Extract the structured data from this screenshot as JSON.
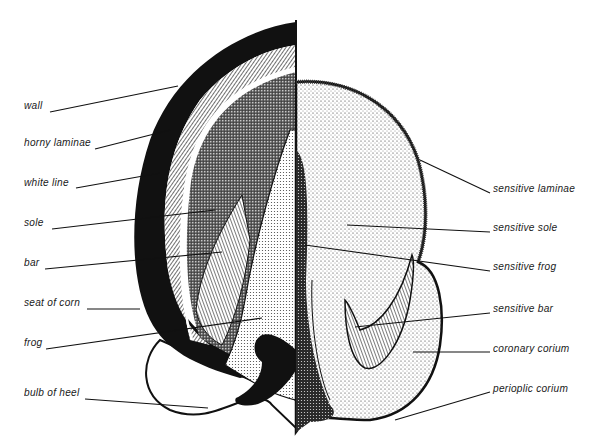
{
  "diagram": {
    "colors": {
      "ink": "#111111",
      "paper": "#ffffff"
    },
    "left_labels": [
      {
        "text": "wall",
        "x": 24,
        "y": 106,
        "line": [
          50,
          112,
          178,
          86
        ]
      },
      {
        "text": "horny laminae",
        "x": 24,
        "y": 143,
        "line": [
          95,
          149,
          170,
          130
        ]
      },
      {
        "text": "white line",
        "x": 24,
        "y": 183,
        "line": [
          76,
          188,
          160,
          173
        ]
      },
      {
        "text": "sole",
        "x": 24,
        "y": 223,
        "line": [
          52,
          229,
          215,
          210
        ]
      },
      {
        "text": "bar",
        "x": 24,
        "y": 263,
        "line": [
          45,
          269,
          222,
          252
        ]
      },
      {
        "text": "seat of corn",
        "x": 24,
        "y": 303,
        "line": [
          87,
          309,
          140,
          309
        ]
      },
      {
        "text": "frog",
        "x": 24,
        "y": 343,
        "line": [
          46,
          349,
          262,
          318
        ]
      },
      {
        "text": "bulb of heel",
        "x": 24,
        "y": 393,
        "line": [
          85,
          399,
          208,
          408
        ]
      }
    ],
    "right_labels": [
      {
        "text": "sensitive laminae",
        "x": 493,
        "y": 189,
        "line": [
          490,
          193,
          420,
          160
        ]
      },
      {
        "text": "sensitive sole",
        "x": 493,
        "y": 228,
        "line": [
          490,
          232,
          347,
          225
        ]
      },
      {
        "text": "sensitive frog",
        "x": 493,
        "y": 267,
        "line": [
          490,
          271,
          305,
          245
        ]
      },
      {
        "text": "sensitive bar",
        "x": 493,
        "y": 309,
        "line": [
          490,
          313,
          355,
          327
        ]
      },
      {
        "text": "coronary corium",
        "x": 493,
        "y": 349,
        "line": [
          490,
          352,
          413,
          352
        ]
      },
      {
        "text": "perioplic corium",
        "x": 493,
        "y": 389,
        "line": [
          490,
          392,
          395,
          420
        ]
      }
    ]
  }
}
